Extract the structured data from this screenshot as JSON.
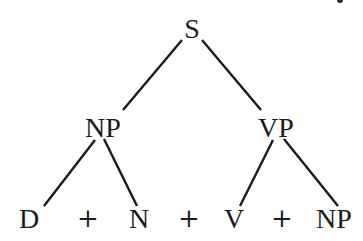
{
  "diagram": {
    "type": "syntax-tree",
    "root": {
      "label": "S",
      "children": [
        {
          "label": "NP",
          "children": [
            {
              "label": "D"
            },
            {
              "label": "N"
            }
          ]
        },
        {
          "label": "VP",
          "children": [
            {
              "label": "V"
            },
            {
              "label": "NP"
            }
          ]
        }
      ]
    },
    "nodes": {
      "s": "S",
      "np": "NP",
      "vp": "VP"
    },
    "leaves": [
      {
        "label": "D"
      },
      {
        "label": "+"
      },
      {
        "label": "N"
      },
      {
        "label": "+"
      },
      {
        "label": "V"
      },
      {
        "label": "+"
      },
      {
        "label": "NP"
      }
    ],
    "edges": [
      {
        "from": "S",
        "to": "NP"
      },
      {
        "from": "S",
        "to": "VP"
      },
      {
        "from": "NP",
        "to": "D"
      },
      {
        "from": "NP",
        "to": "N"
      },
      {
        "from": "VP",
        "to": "V"
      },
      {
        "from": "VP",
        "to": "NP"
      }
    ],
    "colors": {
      "ink": "#1a1a1a",
      "background": "#ffffff"
    }
  }
}
